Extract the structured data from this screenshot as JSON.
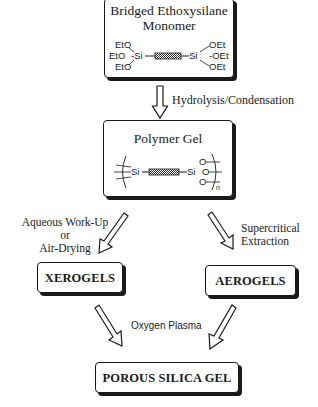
{
  "diagram": {
    "nodes": {
      "monomer": {
        "title_line1": "Bridged Ethoxysilane",
        "title_line2": "Monomer",
        "structure": {
          "left_groups": [
            "EtO",
            "EtO",
            "EtO"
          ],
          "right_groups": [
            "OEt",
            "OEt",
            "OEt"
          ],
          "si": "Si"
        }
      },
      "polymer_gel": {
        "title": "Polymer Gel",
        "structure": {
          "si": "Si",
          "o": "O",
          "n": "n"
        }
      },
      "xerogels": {
        "title": "XEROGELS"
      },
      "aerogels": {
        "title": "AEROGELS"
      },
      "porous_silica": {
        "title": "POROUS SILICA GEL"
      }
    },
    "edges": {
      "hydrolysis": {
        "label": "Hydrolysis/Condensation"
      },
      "aqueous": {
        "line1": "Aqueous Work-Up",
        "line2": "or",
        "line3": "Air-Drying"
      },
      "supercritical": {
        "line1": "Supercritical",
        "line2": "Extraction"
      },
      "oxygen_plasma": {
        "label": "Oxygen Plasma"
      }
    }
  }
}
